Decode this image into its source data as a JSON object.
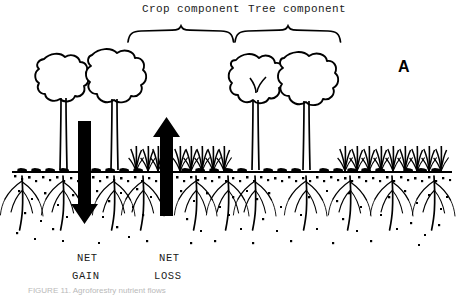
{
  "figure": {
    "panel_label": "A",
    "brackets": [
      {
        "id": "crop",
        "label": "Crop component",
        "x_start": 128,
        "x_end": 233
      },
      {
        "id": "tree",
        "label": "Tree component",
        "x_start": 235,
        "x_end": 340
      }
    ],
    "flow_labels": [
      {
        "id": "net-gain",
        "line1": "NET",
        "line2": "GAIN",
        "direction": "down",
        "x": 84
      },
      {
        "id": "net-loss",
        "line1": "NET",
        "line2": "LOSS",
        "direction": "up",
        "x": 166
      }
    ],
    "arrows": [
      {
        "id": "down-arrow",
        "direction": "down",
        "meaning": "NET GAIN",
        "x": 84,
        "top": 121,
        "tip": 224
      },
      {
        "id": "up-arrow",
        "direction": "up",
        "meaning": "NET LOSS",
        "x": 166,
        "tip": 117,
        "bottom": 216
      }
    ],
    "ground_line_y": 172,
    "soil_bottom_y": 248,
    "colors": {
      "ink": "#000000",
      "background": "#ffffff",
      "label_text": "#1a1a1a",
      "caption_text": "#b9b9b9"
    },
    "caption": "FIGURE 11. Agroforestry nutrient flows"
  }
}
